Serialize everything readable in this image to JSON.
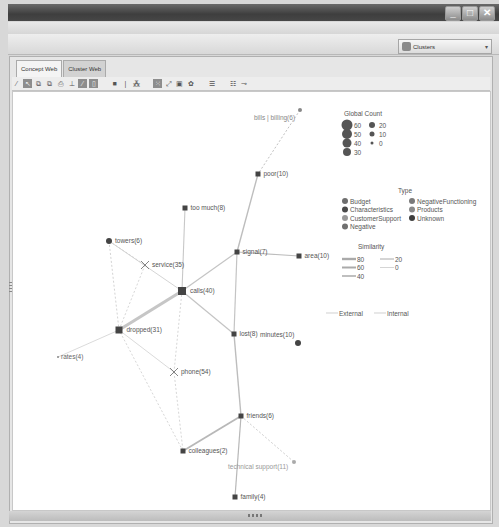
{
  "window": {
    "controls": [
      {
        "name": "minimize-button",
        "glyph": "_"
      },
      {
        "name": "maximize-button",
        "glyph": "□"
      },
      {
        "name": "close-button",
        "glyph": "✕"
      }
    ]
  },
  "header": {
    "view_selector": {
      "value": "Clusters",
      "icon": "clusters-icon",
      "arrow": "▾"
    }
  },
  "tabs": [
    {
      "label": "Concept Web",
      "active": true
    },
    {
      "label": "Cluster Web",
      "active": false
    }
  ],
  "toolbar": {
    "buttons": [
      {
        "icon": "brush-icon",
        "glyph": "⁄",
        "on": false
      },
      {
        "icon": "select-arrow-icon",
        "glyph": "↖",
        "on": true
      },
      {
        "icon": "copy-icon",
        "glyph": "⧉",
        "on": false
      },
      {
        "icon": "paste-icon",
        "glyph": "⧉",
        "on": false
      },
      {
        "icon": "print-icon",
        "glyph": "⎙",
        "on": false
      },
      {
        "icon": "connect-icon",
        "glyph": "⊥",
        "on": false
      },
      {
        "icon": "edge-tool-icon",
        "glyph": "⁄",
        "on": true
      },
      {
        "icon": "node-tool-icon",
        "glyph": "▯",
        "on": true
      },
      {
        "gap": true
      },
      {
        "icon": "fill-square-icon",
        "glyph": "■",
        "on": false
      },
      {
        "icon": "divider-line-icon",
        "glyph": "|",
        "on": false
      },
      {
        "icon": "magic-wand-icon",
        "glyph": "⁂",
        "on": false
      },
      {
        "gap": true
      },
      {
        "icon": "layout-grid-icon",
        "glyph": "⁙",
        "on": true
      },
      {
        "icon": "expand-icon",
        "glyph": "⤢",
        "on": false
      },
      {
        "icon": "window-icon",
        "glyph": "▣",
        "on": false
      },
      {
        "icon": "circle-layout-icon",
        "glyph": "✿",
        "on": false
      },
      {
        "gap": true
      },
      {
        "icon": "filter-icon",
        "glyph": "☰",
        "on": false
      },
      {
        "gap": true
      },
      {
        "icon": "list-icon",
        "glyph": "☷",
        "on": false
      },
      {
        "icon": "node-link-icon",
        "glyph": "⊸",
        "on": false
      }
    ]
  },
  "graph": {
    "nodes": [
      {
        "id": "bills",
        "label": "bills | billing(6)",
        "x": 299,
        "y": 109,
        "shape": "dot",
        "size": 2,
        "label_dx": -48,
        "label_dy": 10,
        "color": "#888888",
        "text_color": "#888888"
      },
      {
        "id": "poor",
        "label": "poor(10)",
        "x": 257,
        "y": 173,
        "shape": "square",
        "size": 5,
        "label_dx": 3,
        "label_dy": 2,
        "color": "#444444",
        "text_color": "#555555"
      },
      {
        "id": "toomuch",
        "label": "too much(8)",
        "x": 184,
        "y": 207,
        "shape": "square",
        "size": 5,
        "label_dx": 3,
        "label_dy": 2,
        "color": "#444444",
        "text_color": "#555555"
      },
      {
        "id": "towers",
        "label": "towers(6)",
        "x": 108,
        "y": 240,
        "shape": "dot",
        "size": 3,
        "label_dx": 3,
        "label_dy": 2,
        "color": "#444444",
        "text_color": "#555555"
      },
      {
        "id": "signal",
        "label": "signal(7)",
        "x": 236,
        "y": 251,
        "shape": "square",
        "size": 5,
        "label_dx": 3,
        "label_dy": 2,
        "color": "#444444",
        "text_color": "#555555"
      },
      {
        "id": "area",
        "label": "area(10)",
        "x": 298,
        "y": 255,
        "shape": "square",
        "size": 5,
        "label_dx": 3,
        "label_dy": 2,
        "color": "#444444",
        "text_color": "#555555"
      },
      {
        "id": "service",
        "label": "service(35)",
        "x": 144,
        "y": 264,
        "shape": "x",
        "size": 4,
        "label_dx": 3,
        "label_dy": 2,
        "color": "#777777",
        "text_color": "#555555"
      },
      {
        "id": "calls",
        "label": "calls(40)",
        "x": 181,
        "y": 290,
        "shape": "square",
        "size": 8,
        "label_dx": 4,
        "label_dy": 2,
        "color": "#444444",
        "text_color": "#555555"
      },
      {
        "id": "dropped",
        "label": "dropped(31)",
        "x": 118,
        "y": 329,
        "shape": "square",
        "size": 7,
        "label_dx": 4,
        "label_dy": 2,
        "color": "#444444",
        "text_color": "#555555"
      },
      {
        "id": "lost",
        "label": "lost(8)",
        "x": 233,
        "y": 333,
        "shape": "square",
        "size": 5,
        "label_dx": 3,
        "label_dy": 2,
        "color": "#444444",
        "text_color": "#555555"
      },
      {
        "id": "minutes",
        "label": "minutes(10)",
        "x": 297,
        "y": 342,
        "shape": "dot",
        "size": 3,
        "label_dx": -41,
        "label_dy": -6,
        "color": "#444444",
        "text_color": "#555555"
      },
      {
        "id": "rates",
        "label": "rates(4)",
        "x": 57,
        "y": 356,
        "shape": "dot",
        "size": 1,
        "label_dx": 2,
        "label_dy": 2,
        "color": "#888888",
        "text_color": "#666666"
      },
      {
        "id": "phone",
        "label": "phone(54)",
        "x": 173,
        "y": 371,
        "shape": "x",
        "size": 4,
        "label_dx": 3,
        "label_dy": 2,
        "color": "#777777",
        "text_color": "#555555"
      },
      {
        "id": "friends",
        "label": "friends(6)",
        "x": 240,
        "y": 415,
        "shape": "square",
        "size": 5,
        "label_dx": 3,
        "label_dy": 2,
        "color": "#444444",
        "text_color": "#555555"
      },
      {
        "id": "colleagues",
        "label": "colleagues(2)",
        "x": 182,
        "y": 450,
        "shape": "square",
        "size": 5,
        "label_dx": 3,
        "label_dy": 2,
        "color": "#444444",
        "text_color": "#555555"
      },
      {
        "id": "techsupport",
        "label": "technical support(11)",
        "x": 293,
        "y": 461,
        "shape": "dot",
        "size": 2,
        "label_dx": -68,
        "label_dy": 7,
        "color": "#aaaaaa",
        "text_color": "#999999"
      },
      {
        "id": "family",
        "label": "family(4)",
        "x": 234,
        "y": 496,
        "shape": "square",
        "size": 5,
        "label_dx": 3,
        "label_dy": 2,
        "color": "#444444",
        "text_color": "#555555"
      }
    ],
    "edges": [
      {
        "from": "bills",
        "to": "poor",
        "width": 0.8,
        "dash": "2,2",
        "color": "#b0b0b0"
      },
      {
        "from": "poor",
        "to": "signal",
        "width": 1.4,
        "dash": "",
        "color": "#bdbdbd"
      },
      {
        "from": "toomuch",
        "to": "calls",
        "width": 1.1,
        "dash": "",
        "color": "#c8c8c8"
      },
      {
        "from": "signal",
        "to": "area",
        "width": 1.1,
        "dash": "",
        "color": "#bdbdbd"
      },
      {
        "from": "signal",
        "to": "calls",
        "width": 1.2,
        "dash": "",
        "color": "#c4c4c4"
      },
      {
        "from": "signal",
        "to": "lost",
        "width": 1.2,
        "dash": "",
        "color": "#c4c4c4"
      },
      {
        "from": "towers",
        "to": "calls",
        "width": 0.9,
        "dash": "",
        "color": "#cfcfcf"
      },
      {
        "from": "towers",
        "to": "dropped",
        "width": 0.8,
        "dash": "2,2",
        "color": "#c8c8c8"
      },
      {
        "from": "towers",
        "to": "service",
        "width": 0.8,
        "dash": "2,2",
        "color": "#cccccc"
      },
      {
        "from": "service",
        "to": "dropped",
        "width": 0.8,
        "dash": "2,2",
        "color": "#cccccc"
      },
      {
        "from": "calls",
        "to": "dropped",
        "width": 3.2,
        "dash": "",
        "color": "#c6c6c6"
      },
      {
        "from": "calls",
        "to": "lost",
        "width": 1.2,
        "dash": "",
        "color": "#c4c4c4"
      },
      {
        "from": "calls",
        "to": "phone",
        "width": 0.8,
        "dash": "2,2",
        "color": "#cccccc"
      },
      {
        "from": "dropped",
        "to": "rates",
        "width": 0.8,
        "dash": "",
        "color": "#d0d0d0"
      },
      {
        "from": "dropped",
        "to": "phone",
        "width": 0.8,
        "dash": "",
        "color": "#d0d0d0"
      },
      {
        "from": "lost",
        "to": "friends",
        "width": 1.4,
        "dash": "",
        "color": "#bdbdbd"
      },
      {
        "from": "phone",
        "to": "colleagues",
        "width": 0.8,
        "dash": "2,2",
        "color": "#cccccc"
      },
      {
        "from": "friends",
        "to": "colleagues",
        "width": 1.8,
        "dash": "",
        "color": "#b8b8b8"
      },
      {
        "from": "friends",
        "to": "family",
        "width": 1.2,
        "dash": "",
        "color": "#b8b8b8"
      },
      {
        "from": "friends",
        "to": "techsupport",
        "width": 0.8,
        "dash": "2,2",
        "color": "#c0c0c0"
      },
      {
        "from": "colleagues",
        "to": "dropped",
        "width": 0.8,
        "dash": "2,2",
        "color": "#cccccc"
      }
    ]
  },
  "legend": {
    "global_count": {
      "title": "Global Count",
      "items": [
        {
          "label": "60",
          "r": 5.5,
          "col": 0,
          "row": 0
        },
        {
          "label": "50",
          "r": 5,
          "col": 0,
          "row": 1
        },
        {
          "label": "40",
          "r": 4.5,
          "col": 0,
          "row": 2
        },
        {
          "label": "30",
          "r": 4,
          "col": 0,
          "row": 3
        },
        {
          "label": "20",
          "r": 3,
          "col": 1,
          "row": 0
        },
        {
          "label": "10",
          "r": 2.5,
          "col": 1,
          "row": 1
        },
        {
          "label": "0",
          "r": 1.5,
          "col": 1,
          "row": 2
        }
      ]
    },
    "type": {
      "title": "Type",
      "items": [
        {
          "label": "Budget",
          "color": "#6e6e6e",
          "col": 0,
          "row": 0
        },
        {
          "label": "Characteristics",
          "color": "#4a4a4a",
          "col": 0,
          "row": 1
        },
        {
          "label": "CustomerSupport",
          "color": "#999999",
          "col": 0,
          "row": 2
        },
        {
          "label": "Negative",
          "color": "#707070",
          "col": 0,
          "row": 3
        },
        {
          "label": "NegativeFunctioning",
          "color": "#7a7a7a",
          "col": 1,
          "row": 0
        },
        {
          "label": "Products",
          "color": "#8a8a8a",
          "col": 1,
          "row": 1
        },
        {
          "label": "Unknown",
          "color": "#3e3e3e",
          "col": 1,
          "row": 2
        }
      ]
    },
    "similarity": {
      "title": "Similarity",
      "items": [
        {
          "label": "80",
          "w": 2.4,
          "col": 0,
          "row": 0
        },
        {
          "label": "60",
          "w": 2,
          "col": 0,
          "row": 1
        },
        {
          "label": "40",
          "w": 1.5,
          "col": 0,
          "row": 2
        },
        {
          "label": "20",
          "w": 1,
          "col": 1,
          "row": 0
        },
        {
          "label": "0",
          "w": 0.5,
          "col": 1,
          "row": 1
        }
      ]
    },
    "link_kind": [
      {
        "label": "External",
        "x": 337
      },
      {
        "label": "Internal",
        "x": 385
      }
    ]
  }
}
